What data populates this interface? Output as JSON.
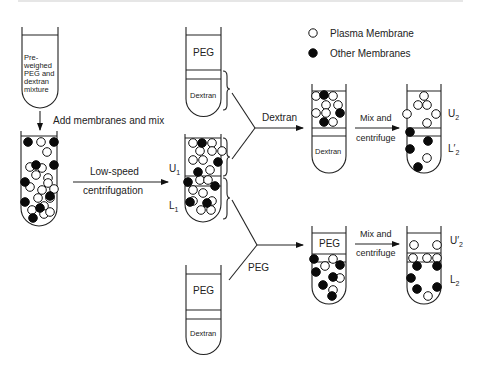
{
  "legend": {
    "plasma_membrane": "Plasma Membrane",
    "other_membranes": "Other Membranes"
  },
  "tube1": {
    "label_lines": [
      "Pre-",
      "weighed",
      "PEG and",
      "dextran",
      "mixture"
    ]
  },
  "steps": {
    "add": "Add membranes and mix",
    "low_speed_1": "Low-speed",
    "low_speed_2": "centrifugation",
    "dextran_branch": "Dextran",
    "peg_branch": "PEG",
    "mix_top_1": "Mix and",
    "mix_top_2": "centrifuge",
    "mix_bottom_1": "Mix and",
    "mix_bottom_2": "centrifuge"
  },
  "phase_labels": {
    "peg_top": "PEG",
    "dextran_top": "Dextran",
    "peg_bottom": "PEG",
    "dextran_bottom": "Dextran",
    "dextran_tube6": "Dextran",
    "peg_tube8": "PEG",
    "U1": "U",
    "U1_sub": "1",
    "L1": "L",
    "L1_sub": "1",
    "U2": "U",
    "U2_sub": "2",
    "L2p": "L′",
    "L2p_sub": "2",
    "U2p": "U′",
    "U2p_sub": "2",
    "L2": "L",
    "L2_sub": "2"
  },
  "tubes": {
    "mixed": {
      "open": [
        [
          41,
          142
        ],
        [
          47,
          152
        ],
        [
          30,
          167
        ],
        [
          36,
          175
        ],
        [
          42,
          168
        ],
        [
          48,
          178
        ],
        [
          30,
          187
        ],
        [
          42,
          190
        ],
        [
          48,
          183
        ],
        [
          38,
          198
        ],
        [
          50,
          198
        ],
        [
          44,
          206
        ],
        [
          54,
          189
        ],
        [
          32,
          210
        ],
        [
          44,
          214
        ],
        [
          50,
          212
        ]
      ],
      "filled": [
        [
          28,
          142
        ],
        [
          54,
          142
        ],
        [
          36,
          165
        ],
        [
          54,
          165
        ],
        [
          25,
          182
        ],
        [
          50,
          196
        ],
        [
          25,
          202
        ],
        [
          40,
          208
        ],
        [
          33,
          218
        ]
      ]
    },
    "separated": {
      "open": [
        [
          193,
          143
        ],
        [
          212,
          143
        ],
        [
          200,
          151
        ],
        [
          212,
          151
        ],
        [
          222,
          151
        ],
        [
          193,
          160
        ],
        [
          203,
          160
        ],
        [
          210,
          170
        ],
        [
          200,
          180
        ],
        [
          208,
          180
        ],
        [
          193,
          190
        ],
        [
          203,
          193
        ],
        [
          193,
          201
        ],
        [
          212,
          201
        ],
        [
          201,
          210
        ],
        [
          211,
          210
        ]
      ],
      "filled": [
        [
          202,
          143
        ],
        [
          218,
          162
        ],
        [
          198,
          172
        ],
        [
          188,
          182
        ],
        [
          215,
          186
        ],
        [
          190,
          202
        ],
        [
          207,
          203
        ]
      ]
    },
    "upper_dextran": {
      "open": [
        [
          316,
          96
        ],
        [
          333,
          96
        ],
        [
          326,
          105
        ],
        [
          338,
          105
        ],
        [
          316,
          113
        ],
        [
          326,
          113
        ],
        [
          333,
          122
        ]
      ],
      "filled": [
        [
          324,
          95
        ],
        [
          340,
          113
        ],
        [
          324,
          122
        ]
      ]
    },
    "upper_result": {
      "open": [
        [
          424,
          96
        ],
        [
          418,
          105
        ],
        [
          427,
          105
        ],
        [
          407,
          114
        ],
        [
          436,
          114
        ],
        [
          427,
          123
        ]
      ],
      "filled": [
        [
          410,
          132
        ],
        [
          428,
          141
        ],
        [
          410,
          149
        ],
        [
          418,
          167
        ]
      ],
      "open_lower": [
        [
          427,
          158
        ]
      ]
    },
    "lower_peg": {
      "open": [
        [
          333,
          259
        ],
        [
          325,
          266
        ],
        [
          340,
          278
        ],
        [
          333,
          290
        ]
      ],
      "filled": [
        [
          314,
          259
        ],
        [
          340,
          265
        ],
        [
          316,
          272
        ],
        [
          333,
          277
        ],
        [
          323,
          285
        ],
        [
          332,
          296
        ]
      ]
    },
    "lower_result": {
      "open": [
        [
          414,
          245
        ],
        [
          437,
          245
        ],
        [
          413,
          258
        ],
        [
          427,
          258
        ],
        [
          437,
          258
        ],
        [
          428,
          296
        ]
      ],
      "filled": [
        [
          417,
          266
        ],
        [
          437,
          266
        ],
        [
          411,
          278
        ],
        [
          417,
          289
        ],
        [
          437,
          287
        ]
      ]
    }
  }
}
